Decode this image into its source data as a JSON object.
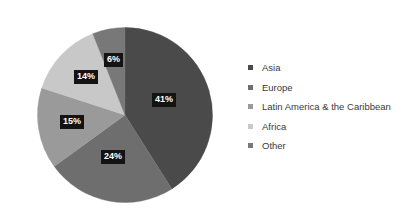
{
  "chart_data": {
    "type": "pie",
    "title": "",
    "subtitle": "",
    "xlabel": "",
    "ylabel": "",
    "grid": false,
    "legend_position": "right",
    "start_angle_deg": 0,
    "direction": "clockwise",
    "unit": "%",
    "categories": [
      "Asia",
      "Europe",
      "Latin America & the Caribbean",
      "Africa",
      "Other"
    ],
    "values": [
      41,
      24,
      15,
      14,
      6
    ],
    "labels": [
      "41%",
      "24%",
      "15%",
      "14%",
      "6%"
    ],
    "colors": [
      "#4a4a4a",
      "#6e6e6e",
      "#9a9a9a",
      "#c8c8c8",
      "#787878"
    ],
    "slices": [
      {
        "name": "Asia",
        "value": 41,
        "label": "41%",
        "color": "#4a4a4a"
      },
      {
        "name": "Europe",
        "value": 24,
        "label": "24%",
        "color": "#6e6e6e"
      },
      {
        "name": "Latin America & the Caribbean",
        "value": 15,
        "label": "15%",
        "color": "#9a9a9a"
      },
      {
        "name": "Africa",
        "value": 14,
        "label": "14%",
        "color": "#c8c8c8"
      },
      {
        "name": "Other",
        "value": 6,
        "label": "6%",
        "color": "#787878"
      }
    ],
    "data_label_style": {
      "text_color": "#ffffff",
      "background_color": "#131313"
    }
  },
  "legend": {
    "items": [
      {
        "label": "Asia",
        "color": "#4a4a4a"
      },
      {
        "label": "Europe",
        "color": "#6e6e6e"
      },
      {
        "label": "Latin America & the Caribbean",
        "color": "#9a9a9a"
      },
      {
        "label": "Africa",
        "color": "#c8c8c8"
      },
      {
        "label": "Other",
        "color": "#787878"
      }
    ]
  },
  "figure": {
    "background_color": "#ffffff"
  }
}
